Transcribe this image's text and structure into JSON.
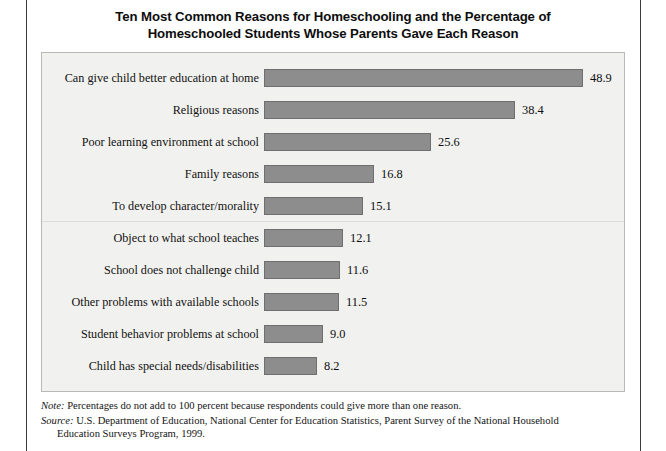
{
  "figure": {
    "title_lines": [
      "Ten Most Common Reasons for Homeschooling and the Percentage of",
      "Homeschooled Students Whose Parents Gave Each Reason"
    ],
    "panel_background": "#f1f1ef",
    "panel_border": "#b9b9b6",
    "frame_color": "#3a3a3a"
  },
  "chart_data": {
    "type": "bar",
    "orientation": "horizontal",
    "title": "Ten Most Common Reasons for Homeschooling and the Percentage of Homeschooled Students Whose Parents Gave Each Reason",
    "xlabel": "",
    "ylabel": "",
    "xlim": [
      0,
      48.9
    ],
    "grid": false,
    "legend": null,
    "bar_color": "#8d8d8d",
    "bar_edge_color": "#6f6f6f",
    "value_suffix": "",
    "categories": [
      "Can give child better education at home",
      "Religious reasons",
      "Poor learning environment at school",
      "Family reasons",
      "To develop character/morality",
      "Object to what school teaches",
      "School does not challenge child",
      "Other problems with available schools",
      "Student behavior problems at school",
      "Child has special needs/disabilities"
    ],
    "values": [
      48.9,
      38.4,
      25.6,
      16.8,
      15.1,
      12.1,
      11.6,
      11.5,
      9.0,
      8.2
    ],
    "value_labels": [
      "48.9",
      "38.4",
      "25.6",
      "16.8",
      "15.1",
      "12.1",
      "11.6",
      "11.5",
      "9.0",
      "8.2"
    ],
    "divider_after_index": 4
  },
  "footnotes": {
    "note_lead": "Note:",
    "note_text": " Percentages do not add to 100 percent because respondents could give more than one reason.",
    "source_lead": "Source:",
    "source_text": " U.S. Department of Education, National Center for Education Statistics, Parent Survey of the National Household",
    "source_text_continued": "Education Surveys Program, 1999."
  }
}
